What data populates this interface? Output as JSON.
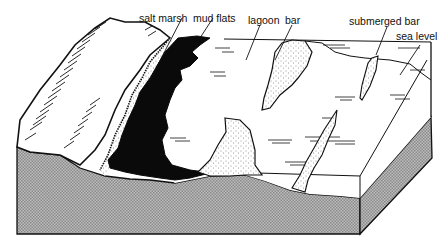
{
  "diagram": {
    "type": "block-diagram",
    "labels": [
      {
        "id": "salt-marsh",
        "text": "salt marsh"
      },
      {
        "id": "mud-flats",
        "text": "mud flats"
      },
      {
        "id": "lagoon",
        "text": "lagoon"
      },
      {
        "id": "bar",
        "text": "bar"
      },
      {
        "id": "submerged-bar",
        "text": "submerged bar"
      },
      {
        "id": "sea-level",
        "text": "sea level"
      }
    ],
    "colors": {
      "ink": "#111111",
      "mud": "#0a0a0a",
      "block_side": "#a8a8a8",
      "background": "#ffffff"
    }
  }
}
